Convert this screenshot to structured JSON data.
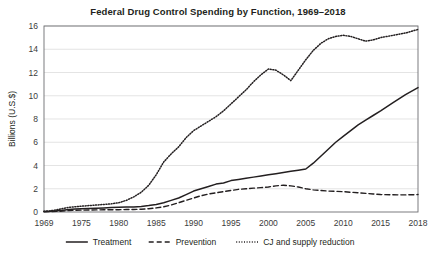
{
  "chart_data": {
    "type": "line",
    "title": "Federal Drug Control Spending by Function, 1969–2018",
    "xlabel": "",
    "ylabel": "Billions (U.S.$)",
    "ylim": [
      0,
      16
    ],
    "ytick_step": 2,
    "yticks": [
      "0",
      "2",
      "4",
      "6",
      "8",
      "10",
      "12",
      "14",
      "16"
    ],
    "xticks": [
      "1969",
      "1975",
      "1980",
      "1985",
      "1990",
      "1995",
      "2000",
      "2005",
      "2010",
      "2015",
      "2018"
    ],
    "xlim": [
      1969,
      2018
    ],
    "grid": "horizontal",
    "legend_position": "bottom",
    "x": [
      1969,
      1970,
      1971,
      1972,
      1973,
      1974,
      1975,
      1976,
      1977,
      1978,
      1979,
      1980,
      1981,
      1982,
      1983,
      1984,
      1985,
      1986,
      1987,
      1988,
      1989,
      1990,
      1991,
      1992,
      1993,
      1994,
      1995,
      1996,
      1997,
      1998,
      1999,
      2000,
      2001,
      2002,
      2003,
      2004,
      2005,
      2006,
      2007,
      2008,
      2009,
      2010,
      2011,
      2012,
      2013,
      2014,
      2015,
      2016,
      2017,
      2018
    ],
    "series": [
      {
        "name": "Treatment",
        "style": "solid",
        "color": "#231f20",
        "values": [
          0.04,
          0.06,
          0.1,
          0.16,
          0.22,
          0.26,
          0.28,
          0.3,
          0.32,
          0.35,
          0.38,
          0.4,
          0.42,
          0.44,
          0.48,
          0.55,
          0.65,
          0.8,
          1.0,
          1.2,
          1.5,
          1.8,
          2.0,
          2.2,
          2.4,
          2.5,
          2.7,
          2.8,
          2.9,
          3.0,
          3.1,
          3.2,
          3.3,
          3.4,
          3.5,
          3.6,
          3.7,
          4.2,
          4.8,
          5.4,
          6.0,
          6.5,
          7.0,
          7.5,
          7.9,
          8.3,
          8.7,
          9.4,
          10.1,
          10.7
        ]
      },
      {
        "name": "Prevention",
        "style": "dashed",
        "color": "#231f20",
        "values": [
          0.02,
          0.03,
          0.05,
          0.08,
          0.12,
          0.15,
          0.16,
          0.17,
          0.18,
          0.19,
          0.2,
          0.2,
          0.21,
          0.22,
          0.24,
          0.28,
          0.35,
          0.45,
          0.6,
          0.8,
          1.0,
          1.2,
          1.4,
          1.55,
          1.65,
          1.75,
          1.85,
          1.95,
          2.0,
          2.05,
          2.1,
          2.15,
          2.25,
          2.3,
          2.25,
          2.15,
          2.0,
          1.9,
          1.85,
          1.8,
          1.78,
          1.75,
          1.7,
          1.65,
          1.6,
          1.55,
          1.5,
          1.48,
          1.47,
          1.5
        ]
      },
      {
        "name": "CJ and supply reduction",
        "style": "dotted",
        "color": "#231f20",
        "values": [
          0.06,
          0.1,
          0.18,
          0.3,
          0.4,
          0.45,
          0.5,
          0.55,
          0.6,
          0.65,
          0.7,
          0.8,
          1.0,
          1.3,
          1.7,
          2.3,
          3.2,
          4.3,
          5.0,
          5.6,
          6.4,
          7.0,
          7.4,
          7.8,
          8.2,
          8.7,
          9.3,
          9.9,
          10.5,
          11.2,
          11.8,
          12.3,
          12.2,
          11.8,
          11.3,
          12.2,
          13.1,
          13.9,
          14.5,
          14.9,
          15.1,
          15.2,
          15.1,
          14.9,
          14.7,
          14.8,
          15.0,
          15.2,
          15.4,
          15.7
        ]
      }
    ]
  },
  "legend": {
    "items": [
      {
        "label": "Treatment",
        "style": "solid"
      },
      {
        "label": "Prevention",
        "style": "dashed"
      },
      {
        "label": "CJ and supply reduction",
        "style": "dotted"
      }
    ]
  }
}
